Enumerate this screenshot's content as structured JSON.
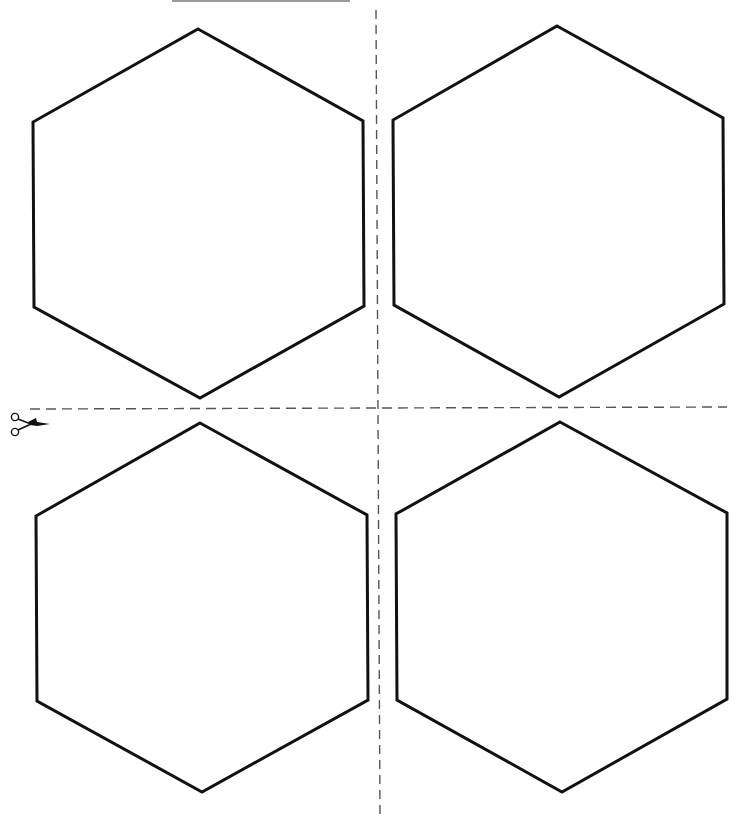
{
  "page": {
    "background": "#ffffff",
    "stroke_color": "#111111",
    "dash_color": "#555555"
  },
  "hexagons": [
    {
      "id": "top-left",
      "points": "198,29 363,121 364,306 200,398 34,307 33,122"
    },
    {
      "id": "top-right",
      "points": "557,26 723,118 724,304 559,397 394,305 393,120"
    },
    {
      "id": "bottom-left",
      "points": "200,423 367,515 368,700 202,792 37,701 36,516"
    },
    {
      "id": "bottom-right",
      "points": "560,422 727,513 727,699 562,792 397,700 396,514"
    }
  ],
  "cut_lines": {
    "vertical": {
      "x1": 376,
      "y1": 10,
      "x2": 380,
      "y2": 820
    },
    "horizontal": {
      "x1": 30,
      "y1": 409,
      "x2": 727,
      "y2": 407
    }
  },
  "icons": {
    "scissors": "scissors-icon"
  },
  "footer": {
    "text": "Copyright notice (text clipped at bottom edge of page)"
  }
}
